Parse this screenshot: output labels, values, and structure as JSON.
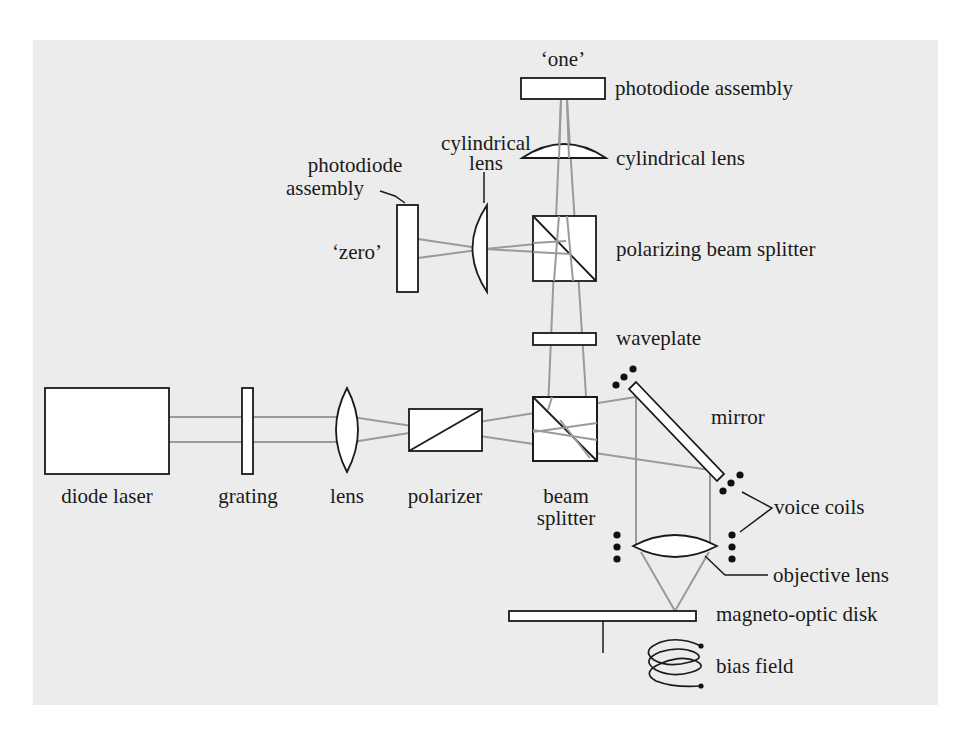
{
  "diagram": {
    "colors": {
      "background": "#ececec",
      "component_fill": "#ffffff",
      "component_stroke": "#1a1a1a",
      "beam": "#9a9a9a"
    },
    "labels": {
      "one": "‘one’",
      "photodiode_assembly_top": "photodiode assembly",
      "cylindrical_lens_right": "cylindrical lens",
      "cylindrical_lens_left_line1": "cylindrical",
      "cylindrical_lens_left_line2": "lens",
      "photodiode_assembly_left_line1": "photodiode",
      "photodiode_assembly_left_line2": "assembly",
      "zero": "‘zero’",
      "polarizing_beam_splitter": "polarizing beam splitter",
      "waveplate": "waveplate",
      "mirror": "mirror",
      "diode_laser": "diode laser",
      "grating": "grating",
      "lens": "lens",
      "polarizer": "polarizer",
      "beam_splitter_line1": "beam",
      "beam_splitter_line2": "splitter",
      "voice_coils": "voice coils",
      "objective_lens": "objective lens",
      "magneto_optic_disk": "magneto-optic disk",
      "bias_field": "bias field"
    },
    "components": [
      {
        "id": "diode-laser",
        "label": "diode laser"
      },
      {
        "id": "grating",
        "label": "grating"
      },
      {
        "id": "lens",
        "label": "lens"
      },
      {
        "id": "polarizer",
        "label": "polarizer"
      },
      {
        "id": "beam-splitter",
        "label": "beam splitter"
      },
      {
        "id": "mirror",
        "label": "mirror"
      },
      {
        "id": "voice-coils",
        "label": "voice coils"
      },
      {
        "id": "objective-lens",
        "label": "objective lens"
      },
      {
        "id": "magneto-optic-disk",
        "label": "magneto-optic disk"
      },
      {
        "id": "bias-field",
        "label": "bias field"
      },
      {
        "id": "waveplate",
        "label": "waveplate"
      },
      {
        "id": "polarizing-beam-splitter",
        "label": "polarizing beam splitter"
      },
      {
        "id": "cylindrical-lens-top",
        "label": "cylindrical lens"
      },
      {
        "id": "photodiode-assembly-one",
        "label": "photodiode assembly ('one')"
      },
      {
        "id": "cylindrical-lens-left",
        "label": "cylindrical lens"
      },
      {
        "id": "photodiode-assembly-zero",
        "label": "photodiode assembly ('zero')"
      }
    ]
  }
}
